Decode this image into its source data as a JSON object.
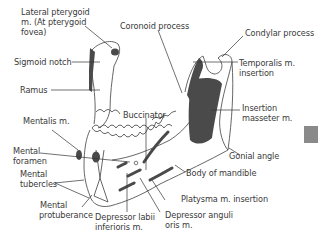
{
  "figure": {
    "labels": {
      "lateral_pterygoid": [
        "Lateral pterygoid",
        "m. (At pterygoid",
        "fovea)"
      ],
      "coronoid_process": "Coronoid process",
      "condylar_process": "Condylar process",
      "sigmoid_notch": "Sigmoid notch",
      "temporalis": [
        "Temporalis  m.",
        "insertion"
      ],
      "ramus": "Ramus",
      "buccinator": "Buccinator",
      "insertion_masseter": [
        "Insertion",
        "masseter m."
      ],
      "mentalis": "Mentalis m.",
      "mental_foramen": [
        "Mental",
        "foramen"
      ],
      "gonial_angle": "Gonial angle",
      "mental_tubercles": [
        "Mental",
        "tubercles"
      ],
      "body_of_mandible": "Body of mandible",
      "platysma": "Platysma m. insertion",
      "mental_protuberance": [
        "Mental",
        "protuberance"
      ],
      "depressor_labii": [
        "Depressor labii",
        "inferioris m."
      ],
      "depressor_anguli": [
        "Depressor anguli",
        "oris m."
      ]
    },
    "colors": {
      "outline": "#555555",
      "muscle_fill": "#4a4a4a",
      "leader": "#333333",
      "tab": "#8a8a8a"
    }
  }
}
